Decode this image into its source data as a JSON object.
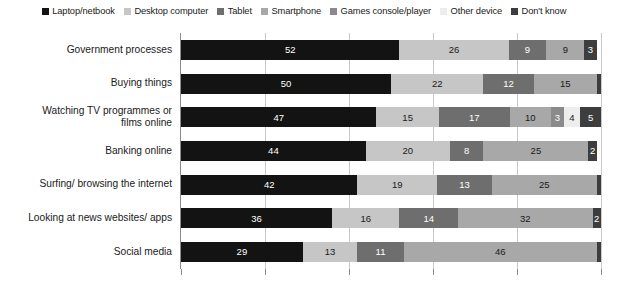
{
  "chart_data": {
    "type": "bar",
    "orientation": "horizontal",
    "stacked": true,
    "stack_mode": "percent",
    "title": "",
    "subtitle": "",
    "xlabel": "",
    "ylabel": "",
    "xlim": [
      0,
      100
    ],
    "grid": true,
    "gridlines": [
      20,
      40,
      60,
      80,
      100
    ],
    "legend_position": "top",
    "categories": [
      "Government processes",
      "Buying things",
      "Watching TV programmes or films online",
      "Banking online",
      "Surfing/ browsing the internet",
      "Looking at news websites/ apps",
      "Social media"
    ],
    "series": [
      {
        "name": "Laptop/netbook",
        "color": "#131313",
        "text_color": "#ffffff",
        "values": [
          52,
          50,
          47,
          44,
          42,
          36,
          29
        ]
      },
      {
        "name": "Desktop computer",
        "color": "#c6c6c6",
        "text_color": "#1a1a1a",
        "values": [
          26,
          22,
          15,
          20,
          19,
          16,
          13
        ]
      },
      {
        "name": "Tablet",
        "color": "#6e6e6e",
        "text_color": "#ffffff",
        "values": [
          9,
          12,
          17,
          8,
          13,
          14,
          11
        ]
      },
      {
        "name": "Smartphone",
        "color": "#a8a8a8",
        "text_color": "#1a1a1a",
        "values": [
          9,
          15,
          10,
          25,
          25,
          32,
          46
        ]
      },
      {
        "name": "Games console/player",
        "color": "#8a8a8a",
        "text_color": "#ffffff",
        "values": [
          0,
          0,
          3,
          0,
          0,
          0,
          0
        ]
      },
      {
        "name": "Other device",
        "color": "#ededed",
        "text_color": "#1a1a1a",
        "values": [
          0,
          0,
          4,
          0,
          0,
          0,
          0
        ]
      },
      {
        "name": "Don't know",
        "color": "#3d3d3d",
        "text_color": "#ffffff",
        "values": [
          3,
          1,
          5,
          2,
          1,
          2,
          1
        ]
      }
    ],
    "data_labels": [
      [
        "52",
        "26",
        "9",
        "9",
        "",
        "",
        "3"
      ],
      [
        "50",
        "22",
        "12",
        "15",
        "",
        "",
        ""
      ],
      [
        "47",
        "15",
        "17",
        "10",
        "3",
        "4",
        "5"
      ],
      [
        "44",
        "20",
        "8",
        "25",
        "",
        "",
        "2"
      ],
      [
        "42",
        "19",
        "13",
        "25",
        "",
        "",
        ""
      ],
      [
        "36",
        "16",
        "14",
        "32",
        "",
        "",
        "2"
      ],
      [
        "29",
        "13",
        "11",
        "46",
        "",
        "",
        ""
      ]
    ]
  },
  "legend": {
    "items": [
      {
        "label": "Laptop/netbook",
        "swatch": "legend-swatch-laptop"
      },
      {
        "label": "Desktop computer",
        "swatch": "legend-swatch-desktop"
      },
      {
        "label": "Tablet",
        "swatch": "legend-swatch-tablet"
      },
      {
        "label": "Smartphone",
        "swatch": "legend-swatch-smartphone"
      },
      {
        "label": "Games console/player",
        "swatch": "legend-swatch-console"
      },
      {
        "label": "Other device",
        "swatch": "legend-swatch-other"
      },
      {
        "label": "Don't know",
        "swatch": "legend-swatch-dontknow"
      }
    ]
  },
  "axis": {
    "category_labels": [
      "Government processes",
      "Buying things",
      "Watching TV programmes or\nfilms online",
      "Banking online",
      "Surfing/ browsing the internet",
      "Looking at news websites/ apps",
      "Social media"
    ]
  }
}
